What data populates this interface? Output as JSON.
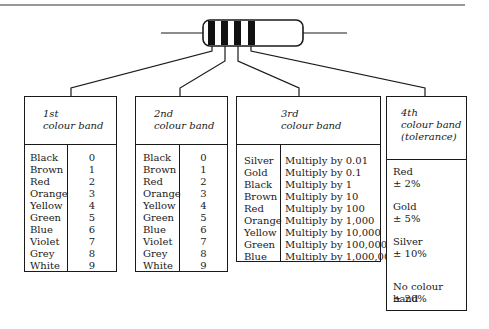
{
  "diagram": {
    "resistor": {
      "bands": 4,
      "band_color": "#111111",
      "body_color": "#ffffff"
    },
    "boxes": [
      {
        "header_line1": "1st",
        "header_line2": "colour band",
        "rows": [
          {
            "colour": "Black",
            "value": "0"
          },
          {
            "colour": "Brown",
            "value": "1"
          },
          {
            "colour": "Red",
            "value": "2"
          },
          {
            "colour": "Orange",
            "value": "3"
          },
          {
            "colour": "Yellow",
            "value": "4"
          },
          {
            "colour": "Green",
            "value": "5"
          },
          {
            "colour": "Blue",
            "value": "6"
          },
          {
            "colour": "Violet",
            "value": "7"
          },
          {
            "colour": "Grey",
            "value": "8"
          },
          {
            "colour": "White",
            "value": "9"
          }
        ]
      },
      {
        "header_line1": "2nd",
        "header_line2": "colour band",
        "rows": [
          {
            "colour": "Black",
            "value": "0"
          },
          {
            "colour": "Brown",
            "value": "1"
          },
          {
            "colour": "Red",
            "value": "2"
          },
          {
            "colour": "Orange",
            "value": "3"
          },
          {
            "colour": "Yellow",
            "value": "4"
          },
          {
            "colour": "Green",
            "value": "5"
          },
          {
            "colour": "Blue",
            "value": "6"
          },
          {
            "colour": "Violet",
            "value": "7"
          },
          {
            "colour": "Grey",
            "value": "8"
          },
          {
            "colour": "White",
            "value": "9"
          }
        ]
      },
      {
        "header_line1": "3rd",
        "header_line2": "colour band",
        "rows": [
          {
            "colour": "Silver",
            "value": "Multiply by 0.01"
          },
          {
            "colour": "Gold",
            "value": "Multiply by 0.1"
          },
          {
            "colour": "Black",
            "value": "Multiply by 1"
          },
          {
            "colour": "Brown",
            "value": "Multiply by 10"
          },
          {
            "colour": "Red",
            "value": "Multiply by 100"
          },
          {
            "colour": "Orange",
            "value": "Multiply by 1,000"
          },
          {
            "colour": "Yellow",
            "value": "Multiply by 10,000"
          },
          {
            "colour": "Green",
            "value": "Multiply by 100,000"
          },
          {
            "colour": "Blue",
            "value": "Multiply by 1,000,000"
          }
        ]
      },
      {
        "header_line1": "4th",
        "header_line2": "colour band",
        "header_line3": "(tolerance)",
        "rows": [
          {
            "colour": "Red",
            "value": "± 2%"
          },
          {
            "colour": "Gold",
            "value": "± 5%"
          },
          {
            "colour": "Silver",
            "value": "± 10%"
          },
          {
            "colour": "No colour band",
            "value": "± 20%"
          }
        ]
      }
    ]
  }
}
